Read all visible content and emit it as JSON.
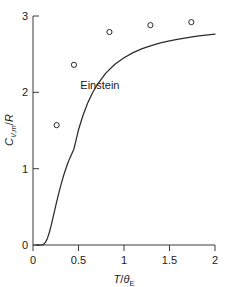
{
  "chart_data": {
    "type": "line",
    "title": "",
    "subtitle": "",
    "xlabel": "T/θE",
    "xlabel_parts": {
      "numerator": "T",
      "slash": "/",
      "denominator": "θ",
      "denominator_sub": "E"
    },
    "ylabel": "CV,m/R",
    "ylabel_parts": {
      "symbol": "C",
      "symbol_sub": "V,m",
      "slash": "/",
      "denominator": "R"
    },
    "xlim": [
      0,
      2
    ],
    "ylim": [
      0,
      3
    ],
    "xticks": [
      0,
      0.5,
      1,
      1.5,
      2
    ],
    "xtick_labels": [
      "0",
      "0.5",
      "1",
      "1.5",
      "2"
    ],
    "yticks": [
      0,
      1,
      2,
      3
    ],
    "ytick_labels": [
      "0",
      "1",
      "2",
      "3"
    ],
    "grid": false,
    "legend": "none",
    "annotations": [
      {
        "text": "Einstein",
        "x": 0.52,
        "y": 2.05,
        "name": "einstein-curve-label"
      }
    ],
    "series": [
      {
        "name": "Einstein",
        "kind": "line",
        "style": "solid",
        "color": "#2b2b2b",
        "formula": "C/R = 3*(theta/T)^2 * exp(theta/T) / (exp(theta/T)-1)^2",
        "x": [
          0.04,
          0.06,
          0.08,
          0.1,
          0.12,
          0.14,
          0.16,
          0.18,
          0.2,
          0.22,
          0.24,
          0.26,
          0.28,
          0.3,
          0.32,
          0.34,
          0.36,
          0.38,
          0.4,
          0.45,
          0.5,
          0.55,
          0.6,
          0.65,
          0.7,
          0.8,
          0.9,
          1.0,
          1.1,
          1.2,
          1.3,
          1.4,
          1.5,
          1.6,
          1.7,
          1.8,
          1.9,
          2.0
        ],
        "y": [
          0.0,
          0.0,
          0.0,
          0.002,
          0.012,
          0.041,
          0.093,
          0.167,
          0.258,
          0.358,
          0.462,
          0.565,
          0.663,
          0.756,
          0.843,
          0.923,
          0.996,
          1.064,
          1.125,
          1.259,
          1.509,
          1.7,
          1.856,
          1.984,
          2.09,
          2.252,
          2.368,
          2.454,
          2.52,
          2.572,
          2.613,
          2.647,
          2.675,
          2.698,
          2.718,
          2.735,
          2.75,
          2.763
        ]
      },
      {
        "name": "experimental data",
        "kind": "scatter",
        "marker": "open-circle",
        "color": "#2b2b2b",
        "x": [
          0.26,
          0.45,
          0.84,
          1.29,
          1.74
        ],
        "y": [
          1.57,
          2.36,
          2.79,
          2.88,
          2.92
        ]
      }
    ]
  }
}
